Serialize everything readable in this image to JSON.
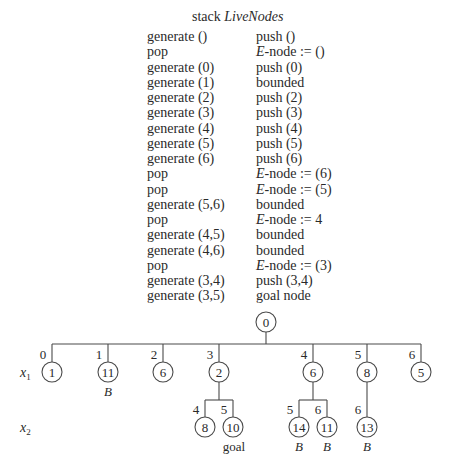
{
  "title": {
    "prefix": "stack ",
    "name": "LiveNodes"
  },
  "trace": [
    {
      "op": "generate ()",
      "res": "push ()"
    },
    {
      "op": "pop",
      "res_italic": "E",
      "res": "-node := ()"
    },
    {
      "op": "generate (0)",
      "res": "push (0)"
    },
    {
      "op": "generate (1)",
      "res": "bounded"
    },
    {
      "op": "generate (2)",
      "res": "push (2)"
    },
    {
      "op": "generate (3)",
      "res": "push (3)"
    },
    {
      "op": "generate (4)",
      "res": "push (4)"
    },
    {
      "op": "generate (5)",
      "res": "push (5)"
    },
    {
      "op": "generate (6)",
      "res": "push (6)"
    },
    {
      "op": "pop",
      "res_italic": "E",
      "res": "-node := (6)"
    },
    {
      "op": "pop",
      "res_italic": "E",
      "res": "-node := (5)"
    },
    {
      "op": "generate (5,6)",
      "res": "bounded"
    },
    {
      "op": "pop",
      "res_italic": "E",
      "res": "-node := 4"
    },
    {
      "op": "generate (4,5)",
      "res": "bounded"
    },
    {
      "op": "generate (4,6)",
      "res": "bounded"
    },
    {
      "op": "pop",
      "res_italic": "E",
      "res": "-node := (3)"
    },
    {
      "op": "generate (3,4)",
      "res": "push (3,4)"
    },
    {
      "op": "generate (3,5)",
      "res": "goal node"
    }
  ],
  "tree": {
    "level_labels": [
      {
        "var": "x",
        "sub": "1",
        "x": 20,
        "y": 377
      },
      {
        "var": "x",
        "sub": "2",
        "x": 20,
        "y": 432
      }
    ],
    "root": {
      "id": "root",
      "value": "0",
      "x": 266,
      "y": 322
    },
    "level1_bar_y": 344,
    "level1": [
      {
        "id": "n1",
        "edge": "0",
        "value": "1",
        "x": 52,
        "note": ""
      },
      {
        "id": "n11",
        "edge": "1",
        "value": "11",
        "x": 108,
        "note": "B"
      },
      {
        "id": "n6a",
        "edge": "2",
        "value": "6",
        "x": 163,
        "note": ""
      },
      {
        "id": "n2",
        "edge": "3",
        "value": "2",
        "x": 219,
        "note": ""
      },
      {
        "id": "n6b",
        "edge": "4",
        "value": "6",
        "x": 313,
        "note": ""
      },
      {
        "id": "n8",
        "edge": "5",
        "value": "8",
        "x": 367,
        "note": ""
      },
      {
        "id": "n5",
        "edge": "6",
        "value": "5",
        "x": 421,
        "note": ""
      }
    ],
    "level1_y": 372,
    "level2_bar_y": 400,
    "level2_y": 427,
    "level2": [
      {
        "parent": "n2",
        "edge": "4",
        "value": "8",
        "x": 205,
        "note": ""
      },
      {
        "parent": "n2",
        "edge": "5",
        "value": "10",
        "x": 233,
        "note": "goal"
      },
      {
        "parent": "n6b",
        "edge": "5",
        "value": "14",
        "x": 299,
        "note": "B"
      },
      {
        "parent": "n6b",
        "edge": "6",
        "value": "11",
        "x": 327,
        "note": "B"
      },
      {
        "parent": "n8",
        "edge": "6",
        "value": "13",
        "x": 367,
        "note": "B"
      }
    ],
    "node_radius": 10,
    "line_color": "#4a4a4a"
  }
}
